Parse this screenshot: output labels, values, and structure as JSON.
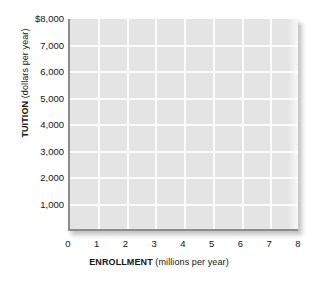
{
  "chart_data": {
    "type": "scatter",
    "title": "",
    "subtitle": "",
    "xlabel_bold": "ENROLLMENT",
    "xlabel_rest": " (millions per year)",
    "ylabel_bold": "TUITION",
    "ylabel_rest": " (dollars per year)",
    "xlim": [
      0,
      8
    ],
    "ylim": [
      0,
      8000
    ],
    "x_ticks": [
      0,
      1,
      2,
      3,
      4,
      5,
      6,
      7,
      8
    ],
    "x_tick_labels": [
      "0",
      "1",
      "2",
      "3",
      "4",
      "5",
      "6",
      "7",
      "8"
    ],
    "y_ticks": [
      1000,
      2000,
      3000,
      4000,
      5000,
      6000,
      7000,
      8000
    ],
    "y_tick_labels": [
      "1,000",
      "2,000",
      "3,000",
      "4,000",
      "5,000",
      "6,000",
      "7,000",
      "$8,000"
    ],
    "grid": true,
    "grid_color": "#fbfbfb",
    "plot_background": "#e4e4e4",
    "axis_color": "#8c8c8c",
    "page_background": "#ffffff",
    "legend": null,
    "legend_position": "none",
    "series": [],
    "values": [],
    "annotations": []
  },
  "axes": {
    "y": {
      "title_bold": "TUITION",
      "title_rest": " (dollars per year)",
      "ticks": [
        {
          "label": "$8,000",
          "value": 8000
        },
        {
          "label": "7,000",
          "value": 7000
        },
        {
          "label": "6,000",
          "value": 6000
        },
        {
          "label": "5,000",
          "value": 5000
        },
        {
          "label": "4,000",
          "value": 4000
        },
        {
          "label": "3,000",
          "value": 3000
        },
        {
          "label": "2,000",
          "value": 2000
        },
        {
          "label": "1,000",
          "value": 1000
        }
      ]
    },
    "x": {
      "title_bold": "ENROLLMENT",
      "title_rest": " (millions per year)",
      "ticks": [
        {
          "label": "0",
          "value": 0
        },
        {
          "label": "1",
          "value": 1
        },
        {
          "label": "2",
          "value": 2
        },
        {
          "label": "3",
          "value": 3
        },
        {
          "label": "4",
          "value": 4
        },
        {
          "label": "5",
          "value": 5
        },
        {
          "label": "6",
          "value": 6
        },
        {
          "label": "7",
          "value": 7
        },
        {
          "label": "8",
          "value": 8
        }
      ]
    }
  }
}
